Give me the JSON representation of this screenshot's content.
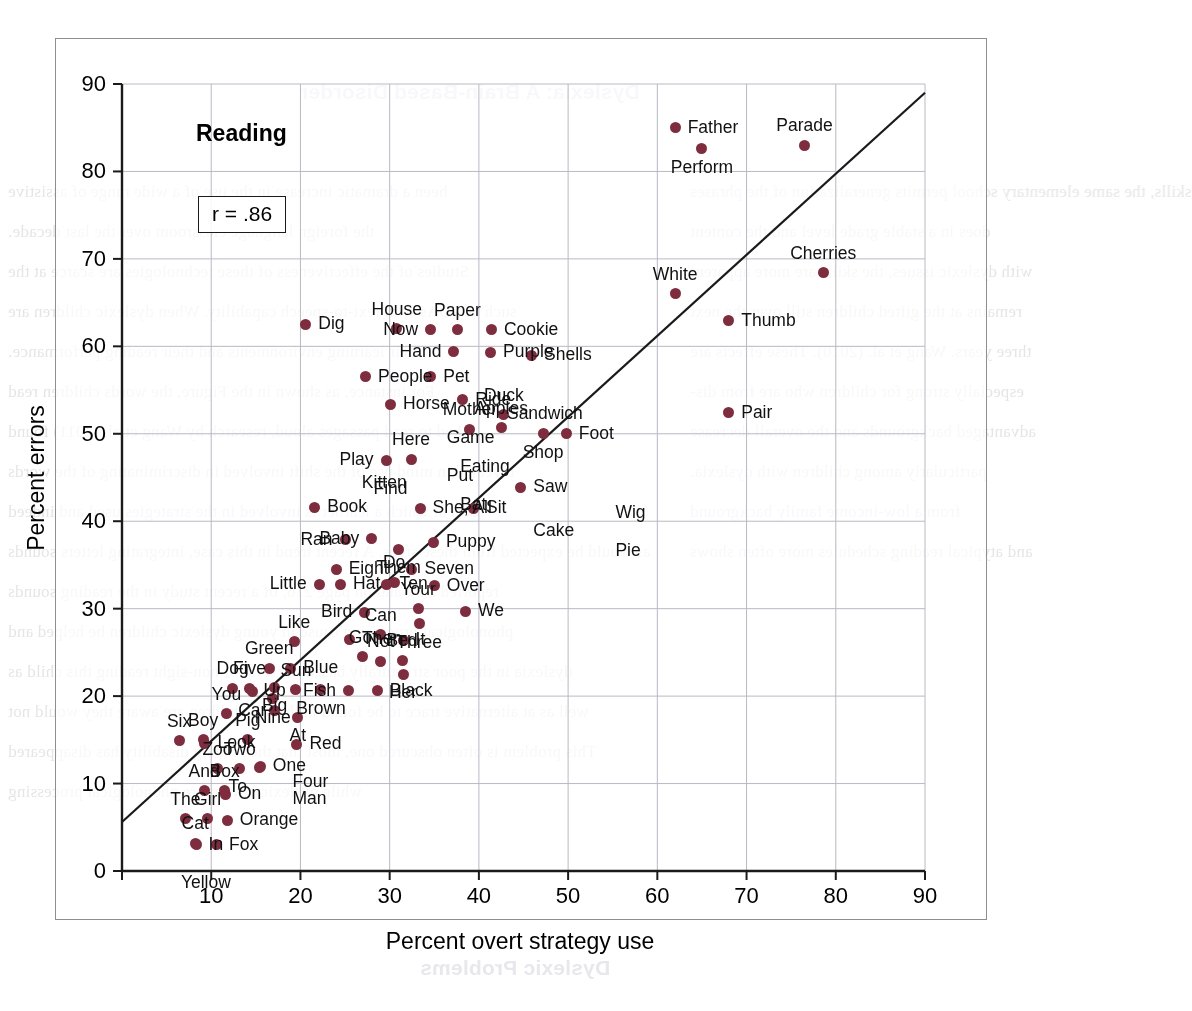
{
  "figure": {
    "panel_title": "Reading",
    "correlation_label": "r = .86"
  },
  "chart_data": {
    "type": "scatter",
    "title": "Reading",
    "xlabel": "Percent overt strategy use",
    "ylabel": "Percent errors",
    "xlim": [
      0,
      90
    ],
    "ylim": [
      0,
      90
    ],
    "xticks": [
      0,
      10,
      20,
      30,
      40,
      50,
      60,
      70,
      80,
      90
    ],
    "yticks": [
      0,
      10,
      20,
      30,
      40,
      50,
      60,
      70,
      80,
      90
    ],
    "grid": true,
    "grid_color": "#b9b9c4",
    "legend": "none",
    "annotations": [
      {
        "text": "r = .86",
        "type": "boxed-text"
      }
    ],
    "correlation": 0.86,
    "point_color": "#7e2d3f",
    "trend_line": {
      "type": "linear-fit",
      "x": [
        0,
        90
      ],
      "y": [
        5.6,
        89.0
      ],
      "color": "#1a1a1a"
    },
    "point_label_field": "word",
    "points": [
      {
        "word": "Father",
        "x": 62.0,
        "y": 85.0,
        "anchor": "left"
      },
      {
        "word": "Perform",
        "x": 65.0,
        "y": 82.6,
        "anchor": "center-below"
      },
      {
        "word": "Parade",
        "x": 76.5,
        "y": 83.0,
        "anchor": "center-above"
      },
      {
        "word": "Cherries",
        "x": 78.6,
        "y": 68.4,
        "anchor": "center-above"
      },
      {
        "word": "White",
        "x": 62.0,
        "y": 66.0,
        "anchor": "center-above"
      },
      {
        "word": "Thumb",
        "x": 68.0,
        "y": 62.9,
        "anchor": "left"
      },
      {
        "word": "Dig",
        "x": 20.6,
        "y": 62.5,
        "anchor": "left"
      },
      {
        "word": "House",
        "x": 30.8,
        "y": 62.0,
        "anchor": "center-above"
      },
      {
        "word": "Now",
        "x": 34.6,
        "y": 61.9,
        "anchor": "right"
      },
      {
        "word": "Paper",
        "x": 37.6,
        "y": 61.9,
        "anchor": "center-above"
      },
      {
        "word": "Cookie",
        "x": 41.4,
        "y": 61.9,
        "anchor": "left"
      },
      {
        "word": "Hand",
        "x": 37.2,
        "y": 59.4,
        "anchor": "right"
      },
      {
        "word": "Purple",
        "x": 41.3,
        "y": 59.3,
        "anchor": "left"
      },
      {
        "word": "Shells",
        "x": 45.9,
        "y": 59.0,
        "anchor": "left"
      },
      {
        "word": "People",
        "x": 27.3,
        "y": 56.5,
        "anchor": "left"
      },
      {
        "word": "Pet",
        "x": 34.6,
        "y": 56.5,
        "anchor": "left"
      },
      {
        "word": "Horse",
        "x": 30.1,
        "y": 53.4,
        "anchor": "left"
      },
      {
        "word": "Ride",
        "x": 38.2,
        "y": 53.9,
        "anchor": "left"
      },
      {
        "word": "Duck",
        "x": 42.8,
        "y": 52.2,
        "anchor": "center-above"
      },
      {
        "word": "Pair",
        "x": 68.0,
        "y": 52.4,
        "anchor": "left"
      },
      {
        "word": "Mother",
        "x": 39.0,
        "y": 50.5,
        "anchor": "center-above"
      },
      {
        "word": "Apples",
        "x": 42.5,
        "y": 50.7,
        "anchor": "center-above"
      },
      {
        "word": "Sandwich",
        "x": 47.4,
        "y": 50.1,
        "anchor": "center-above"
      },
      {
        "word": "Foot",
        "x": 49.8,
        "y": 50.0,
        "anchor": "left"
      },
      {
        "word": "Shop",
        "x": 47.2,
        "y": 50.0,
        "anchor": "center-below"
      },
      {
        "word": "Here",
        "x": 32.4,
        "y": 47.1,
        "anchor": "center-above"
      },
      {
        "word": "Play",
        "x": 29.6,
        "y": 47.0,
        "anchor": "right"
      },
      {
        "word": "Game",
        "x": 35.0,
        "y": 47.4,
        "anchor": "left-above"
      },
      {
        "word": "Put",
        "x": 35.0,
        "y": 47.4,
        "anchor": "left-below"
      },
      {
        "word": "Kitten",
        "x": 33.3,
        "y": 44.4,
        "anchor": "right"
      },
      {
        "word": "Eating",
        "x": 36.5,
        "y": 44.0,
        "anchor": "left-above"
      },
      {
        "word": "Bat",
        "x": 36.5,
        "y": 44.0,
        "anchor": "left-below"
      },
      {
        "word": "Saw",
        "x": 44.7,
        "y": 43.9,
        "anchor": "left"
      },
      {
        "word": "Book",
        "x": 21.6,
        "y": 41.6,
        "anchor": "left"
      },
      {
        "word": "Find",
        "x": 33.4,
        "y": 41.5,
        "anchor": "right-above"
      },
      {
        "word": "She, All",
        "x": 33.4,
        "y": 41.5,
        "anchor": "left"
      },
      {
        "word": "Sit",
        "x": 39.4,
        "y": 41.5,
        "anchor": "left"
      },
      {
        "word": "Cake",
        "x": 44.7,
        "y": 41.0,
        "anchor": "left-below"
      },
      {
        "word": "Wig",
        "x": 53.9,
        "y": 38.8,
        "anchor": "left-above"
      },
      {
        "word": "Pie",
        "x": 53.9,
        "y": 38.8,
        "anchor": "left-below"
      },
      {
        "word": "Ran",
        "x": 25.0,
        "y": 37.9,
        "anchor": "right"
      },
      {
        "word": "Baby",
        "x": 28.0,
        "y": 38.0,
        "anchor": "right"
      },
      {
        "word": "Them",
        "x": 31.0,
        "y": 36.8,
        "anchor": "center-below"
      },
      {
        "word": "Puppy",
        "x": 34.9,
        "y": 37.6,
        "anchor": "left"
      },
      {
        "word": "Eight",
        "x": 24.0,
        "y": 34.5,
        "anchor": "left"
      },
      {
        "word": "Seven",
        "x": 32.5,
        "y": 34.5,
        "anchor": "left"
      },
      {
        "word": "Do",
        "x": 30.5,
        "y": 33.0,
        "anchor": "center-above"
      },
      {
        "word": "Little",
        "x": 22.1,
        "y": 32.8,
        "anchor": "right"
      },
      {
        "word": "Hat",
        "x": 24.5,
        "y": 32.8,
        "anchor": "left"
      },
      {
        "word": "Ten",
        "x": 29.7,
        "y": 32.8,
        "anchor": "left"
      },
      {
        "word": "Over",
        "x": 35.0,
        "y": 32.6,
        "anchor": "left"
      },
      {
        "word": "Bird",
        "x": 27.2,
        "y": 29.6,
        "anchor": "right"
      },
      {
        "word": "Your",
        "x": 33.2,
        "y": 30.0,
        "anchor": "center-above"
      },
      {
        "word": "Three",
        "x": 33.3,
        "y": 28.3,
        "anchor": "center-below"
      },
      {
        "word": "We",
        "x": 38.5,
        "y": 29.7,
        "anchor": "left"
      },
      {
        "word": "Like",
        "x": 19.3,
        "y": 26.2,
        "anchor": "center-above"
      },
      {
        "word": "Then",
        "x": 25.5,
        "y": 26.5,
        "anchor": "left"
      },
      {
        "word": "Can",
        "x": 29.0,
        "y": 27.0,
        "anchor": "center-above"
      },
      {
        "word": "It",
        "x": 31.5,
        "y": 26.4,
        "anchor": "left"
      },
      {
        "word": "Got",
        "x": 27.0,
        "y": 24.5,
        "anchor": "center-above"
      },
      {
        "word": "Not",
        "x": 29.0,
        "y": 24.0,
        "anchor": "center-above"
      },
      {
        "word": "Bed",
        "x": 31.4,
        "y": 24.1,
        "anchor": "center-above"
      },
      {
        "word": "Her",
        "x": 31.5,
        "y": 22.5,
        "anchor": "center-below"
      },
      {
        "word": "Green",
        "x": 16.5,
        "y": 23.2,
        "anchor": "center-above"
      },
      {
        "word": "Blue",
        "x": 18.9,
        "y": 23.2,
        "anchor": "left"
      },
      {
        "word": "Five",
        "x": 14.3,
        "y": 20.9,
        "anchor": "center-above"
      },
      {
        "word": "Big",
        "x": 17.1,
        "y": 21.0,
        "anchor": "center-below"
      },
      {
        "word": "Sun",
        "x": 19.5,
        "y": 20.7,
        "anchor": "center-above"
      },
      {
        "word": "Dog",
        "x": 12.4,
        "y": 20.9,
        "anchor": "center-above"
      },
      {
        "word": "Car",
        "x": 14.6,
        "y": 20.5,
        "anchor": "center-below"
      },
      {
        "word": "Nine",
        "x": 16.9,
        "y": 19.7,
        "anchor": "center-below"
      },
      {
        "word": "Brown",
        "x": 22.3,
        "y": 20.7,
        "anchor": "center-below"
      },
      {
        "word": "Fish",
        "x": 25.4,
        "y": 20.6,
        "anchor": "right"
      },
      {
        "word": "Black",
        "x": 28.6,
        "y": 20.6,
        "anchor": "left"
      },
      {
        "word": "You",
        "x": 11.7,
        "y": 18.0,
        "anchor": "center-above"
      },
      {
        "word": "Up",
        "x": 17.1,
        "y": 18.4,
        "anchor": "center-above"
      },
      {
        "word": "At",
        "x": 19.7,
        "y": 17.6,
        "anchor": "center-below"
      },
      {
        "word": "Six",
        "x": 6.4,
        "y": 14.9,
        "anchor": "center-above"
      },
      {
        "word": "Boy",
        "x": 9.1,
        "y": 15.0,
        "anchor": "center-above"
      },
      {
        "word": "Look",
        "x": 9.3,
        "y": 14.6,
        "anchor": "left"
      },
      {
        "word": "Pig",
        "x": 14.1,
        "y": 15.0,
        "anchor": "center-above"
      },
      {
        "word": "Red",
        "x": 19.6,
        "y": 14.5,
        "anchor": "left"
      },
      {
        "word": "Zoo",
        "x": 10.7,
        "y": 11.7,
        "anchor": "center-above"
      },
      {
        "word": "Two",
        "x": 13.2,
        "y": 11.7,
        "anchor": "center-above"
      },
      {
        "word": "To",
        "x": 15.4,
        "y": 11.8,
        "anchor": "right-below"
      },
      {
        "word": "One",
        "x": 15.5,
        "y": 12.0,
        "anchor": "left"
      },
      {
        "word": "Four",
        "x": 17.7,
        "y": 10.2,
        "anchor": "left-text"
      },
      {
        "word": "Man",
        "x": 17.7,
        "y": 8.2,
        "anchor": "left-text"
      },
      {
        "word": "And",
        "x": 9.2,
        "y": 9.2,
        "anchor": "center-above"
      },
      {
        "word": "Box",
        "x": 11.5,
        "y": 9.2,
        "anchor": "center-above"
      },
      {
        "word": "On",
        "x": 11.6,
        "y": 8.8,
        "anchor": "left"
      },
      {
        "word": "The",
        "x": 7.1,
        "y": 6.0,
        "anchor": "center-above"
      },
      {
        "word": "Girl",
        "x": 9.6,
        "y": 6.0,
        "anchor": "center-above"
      },
      {
        "word": "Orange",
        "x": 11.8,
        "y": 5.8,
        "anchor": "left"
      },
      {
        "word": "Cat",
        "x": 8.2,
        "y": 3.2,
        "anchor": "center-above"
      },
      {
        "word": "In",
        "x": 8.3,
        "y": 3.0,
        "anchor": "left"
      },
      {
        "word": "Fox",
        "x": 10.6,
        "y": 3.0,
        "anchor": "left"
      },
      {
        "word": "Yellow",
        "x": 9.4,
        "y": 0.8,
        "anchor": "center-below"
      }
    ]
  },
  "page_bleed": {
    "lines": [
      "been a dramatic increase in the use of a wide range of assistive",
      "the foreign language classroom over the last decade.",
      "Studies of the effectiveness of these technologies are scarce at the",
      "such as PDAs with text-to-speech capability. When dyslexic children are",
      "their learning environments and their reading performance.",
      "For instance, as shown in the Figure, the words children read",
      "asked to read passages aloud, research by Wang et al. (2011) found",
      "revealed in mind use of the shift involved in discriminating of the words",
      "level at which a learner is involved in the strategies used and indeed",
      "as would be expected from these steps. A recent trend in this case, integrating letters sounds",
      "reported here and on page 216, of a recent study in the reading sounds",
      "phonological processing cause in young dyslexic children be helped and",
      "dyslexia in the poor structurally based retrieval of non-sight reading this child as",
      "well as at alternative trace to be found in that all children are aware they would not",
      "This problem is often obscured one, most that the reading disability has disappeared",
      "while dyslexic have more phonological processing",
      "skills, the same elementary school permits generalization of the phrases",
      "does in a stable grade level and the content",
      "with dyslexic issues, the skills are more apparent",
      "remains at the gifted children still over the next",
      "three years. Wang et al. (2010). These effects are",
      "especially strong for children who are from dis-",
      "advantaged backgrounds and the overall decrease",
      "particularly among children with dyslexia.",
      "from a low-income family background",
      "and atypical reading schedules more often shows"
    ],
    "headings": [
      "Dyslexia: A Brain-Based Disorder",
      "Dyslexic Problems"
    ]
  }
}
